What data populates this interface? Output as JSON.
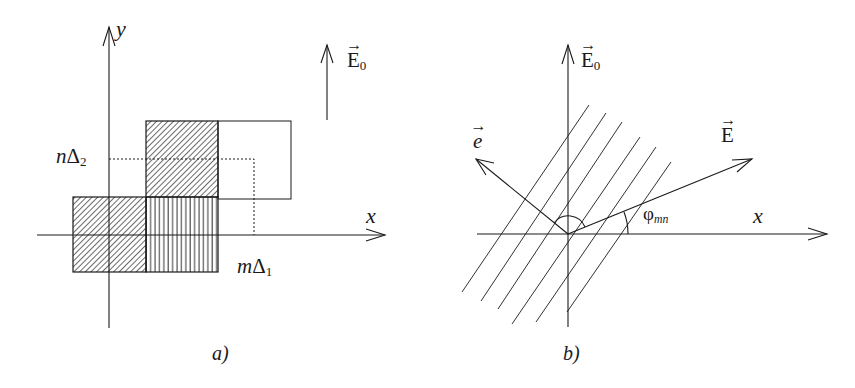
{
  "panels": {
    "a": {
      "caption": "a)",
      "axis_x_label": "x",
      "axis_y_label": "y",
      "field_label": "E",
      "field_subscript": "0",
      "tick_x_label_var": "m",
      "tick_x_label_sym": "Δ",
      "tick_x_label_sub": "1",
      "tick_y_label_var": "n",
      "tick_y_label_sym": "Δ",
      "tick_y_label_sub": "2",
      "cells": [
        {
          "name": "cell-lower-left",
          "pattern": "diagonal-hatch"
        },
        {
          "name": "cell-upper",
          "pattern": "diagonal-hatch"
        },
        {
          "name": "cell-lower-right",
          "pattern": "vertical-stripes"
        },
        {
          "name": "cell-empty-right",
          "pattern": "none"
        }
      ]
    },
    "b": {
      "caption": "b)",
      "axis_x_label": "x",
      "field0_label": "E",
      "field0_subscript": "0",
      "field_label": "E",
      "unit_vector_label": "e",
      "angle_label_sym": "φ",
      "angle_label_sub": "mn",
      "parallel_line_count": 6
    }
  },
  "colors": {
    "ink": "#1a1a1a",
    "background": "#ffffff"
  }
}
